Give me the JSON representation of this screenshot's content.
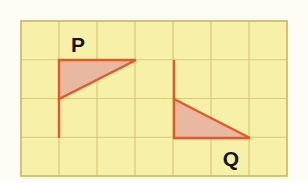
{
  "figure": {
    "background_color": "#fdfcf5",
    "grid": {
      "fill_color": "#f7f0a8",
      "line_color": "#d9c87a",
      "border_color": "#cbb55f",
      "x_start": 21,
      "y_start": 21,
      "columns": 7,
      "rows": 4,
      "cell_width": 38,
      "cell_height": 38.75
    },
    "shapes": [
      {
        "name": "triangle-p",
        "label": "P",
        "fill_color": "#e8b9a0",
        "stroke_color": "#e05a2b",
        "stroke_width": 2.4,
        "points": "59,60 136,60 59,99",
        "label_x": 78,
        "label_y": 52,
        "label_size": 21,
        "tail": {
          "x1": 59,
          "y1": 99,
          "x2": 59,
          "y2": 138
        }
      },
      {
        "name": "triangle-q",
        "label": "Q",
        "fill_color": "#e8b9a0",
        "stroke_color": "#e05a2b",
        "stroke_width": 2.4,
        "points": "174,99 250,138 174,138",
        "label_x": 231,
        "label_y": 166,
        "label_size": 21,
        "tail": {
          "x1": 174,
          "y1": 60,
          "x2": 174,
          "y2": 99
        }
      }
    ]
  }
}
